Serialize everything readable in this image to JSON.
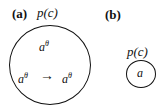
{
  "panel_a": {
    "label": "(a)",
    "set_label_p": "p",
    "set_label_c": "(c)",
    "top_element_base": "a",
    "top_element_sup": "θ",
    "left_element_base": "a",
    "left_element_sup": "θ",
    "arrow": "→",
    "right_element_base": "a",
    "right_element_sup": "θ"
  },
  "panel_b": {
    "label": "(b)",
    "set_label_p": "p",
    "set_label_c": "(c)",
    "element": "a"
  }
}
